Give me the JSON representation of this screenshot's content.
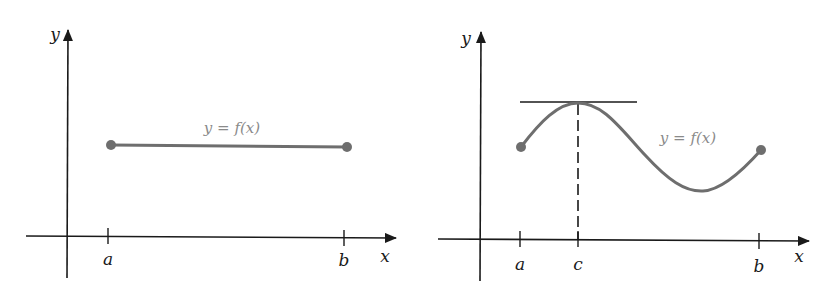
{
  "colors": {
    "axis": "#1a1a1a",
    "curve": "#6e6e6e",
    "label": "#8a8a8a",
    "background": "#ffffff"
  },
  "left_panel": {
    "y_axis_label": "y",
    "x_axis_label": "x",
    "tick_labels": [
      "a",
      "b"
    ],
    "curve_label": "y = f(x)",
    "description": "constant function on [a, b]"
  },
  "right_panel": {
    "y_axis_label": "y",
    "x_axis_label": "x",
    "tick_labels": [
      "a",
      "c",
      "b"
    ],
    "curve_label": "y = f(x)",
    "description": "function with horizontal tangent at x = c"
  }
}
